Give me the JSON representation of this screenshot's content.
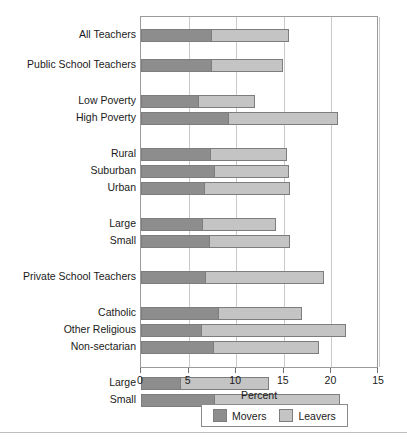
{
  "chart_data": {
    "type": "bar",
    "orientation": "horizontal",
    "stacked": true,
    "title": "",
    "xlabel": "Percent",
    "ylabel": "",
    "xlim": [
      0,
      25
    ],
    "xticks": [
      0,
      5,
      10,
      15,
      20,
      25
    ],
    "xtick_labels": [
      "0",
      "5",
      "10",
      "15",
      "20",
      "15"
    ],
    "grid": true,
    "legend_position": "bottom",
    "categories": [
      "All Teachers",
      "Public School Teachers",
      "Low Poverty",
      "High Poverty",
      "Rural",
      "Suburban",
      "Urban",
      "Large",
      "Small",
      "Private School Teachers",
      "Catholic",
      "Other Religious",
      "Non-sectarian",
      "Large",
      "Small"
    ],
    "series": [
      {
        "name": "Movers",
        "color": "#8d8d8d",
        "values": [
          7.4,
          7.4,
          6.0,
          9.1,
          7.2,
          7.7,
          6.6,
          6.4,
          7.1,
          6.7,
          8.1,
          6.3,
          7.6,
          4.1,
          7.7
        ]
      },
      {
        "name": "Leavers",
        "color": "#c4c4c4",
        "values": [
          8.1,
          7.5,
          6.0,
          11.6,
          8.1,
          7.8,
          9.1,
          7.8,
          8.6,
          12.5,
          8.8,
          15.2,
          11.1,
          9.3,
          13.2
        ]
      }
    ],
    "totals": [
      15.5,
      14.9,
      12.0,
      20.7,
      15.3,
      15.5,
      15.7,
      14.2,
      15.7,
      19.2,
      16.9,
      21.5,
      18.7,
      13.4,
      20.9
    ]
  },
  "legend": {
    "items": [
      {
        "label": "Movers",
        "color": "#8d8d8d"
      },
      {
        "label": "Leavers",
        "color": "#c4c4c4"
      }
    ]
  },
  "axis": {
    "x_title": "Percent"
  }
}
